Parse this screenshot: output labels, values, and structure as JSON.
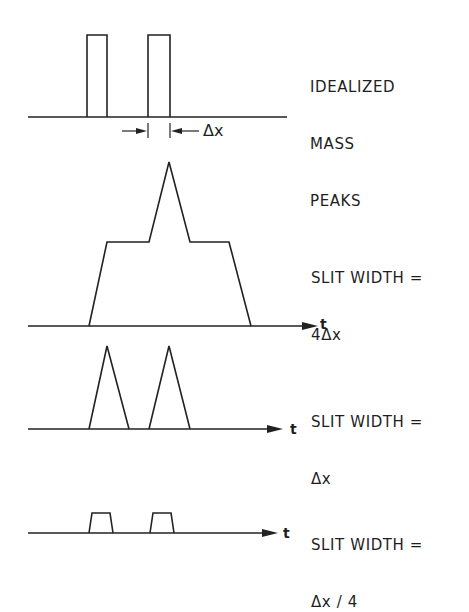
{
  "panels": [
    {
      "id": "idealized",
      "label_lines": [
        "IDEALIZED",
        "MASS",
        "PEAKS"
      ],
      "dimension_label": "Δx",
      "shape": "two narrow rectangular peaks"
    },
    {
      "id": "slit-4dx",
      "label_lines": [
        "SLIT WIDTH =",
        "4Δx"
      ],
      "axis_label": "t",
      "shape": "trapezoid with central triangular spike (peaks merged)"
    },
    {
      "id": "slit-dx",
      "label_lines": [
        "SLIT WIDTH =",
        "Δx"
      ],
      "axis_label": "t",
      "shape": "two triangular peaks"
    },
    {
      "id": "slit-dx4",
      "label_lines": [
        "SLIT WIDTH =",
        "Δx / 4"
      ],
      "axis_label": "t",
      "shape": "two small flat-topped trapezoidal peaks"
    }
  ],
  "colors": {
    "ink": "#222222",
    "background": "#ffffff"
  }
}
